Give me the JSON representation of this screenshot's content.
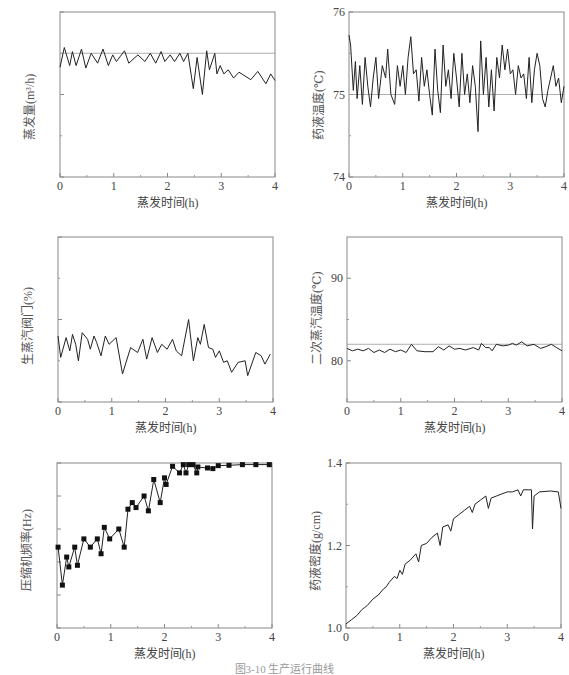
{
  "figure_caption": "图3-10 生产运行曲线",
  "chart_data": [
    {
      "id": "evap_rate",
      "type": "line",
      "title": "",
      "xlabel": "蒸发时间(h)",
      "ylabel": "蒸发量(m³/h)",
      "xlim": [
        0,
        4
      ],
      "ylim": [
        4,
        6
      ],
      "xticks": [
        "0",
        "1",
        "2",
        "3",
        "4"
      ],
      "yticks": [
        "4",
        "5",
        "6"
      ],
      "minor_y": [
        4.5,
        5.5
      ],
      "reference_line": 5.5,
      "series": [
        {
          "name": "蒸发量",
          "x": [
            0,
            0.08,
            0.18,
            0.23,
            0.3,
            0.4,
            0.48,
            0.58,
            0.7,
            0.8,
            0.9,
            0.98,
            1.05,
            1.2,
            1.28,
            1.45,
            1.58,
            1.68,
            1.78,
            1.88,
            1.95,
            2.05,
            2.13,
            2.23,
            2.3,
            2.38,
            2.48,
            2.55,
            2.65,
            2.73,
            2.78,
            2.88,
            2.92,
            2.98,
            3.05,
            3.13,
            3.23,
            3.33,
            3.55,
            3.68,
            3.83,
            3.92,
            4.0
          ],
          "values": [
            5.33,
            5.57,
            5.35,
            5.52,
            5.35,
            5.55,
            5.32,
            5.5,
            5.38,
            5.55,
            5.35,
            5.48,
            5.4,
            5.53,
            5.38,
            5.48,
            5.4,
            5.5,
            5.38,
            5.52,
            5.4,
            5.48,
            5.4,
            5.5,
            5.4,
            5.5,
            5.07,
            5.45,
            5.0,
            5.53,
            5.3,
            5.5,
            5.25,
            5.35,
            5.25,
            5.3,
            5.2,
            5.27,
            5.18,
            5.28,
            5.13,
            5.25,
            5.17
          ]
        }
      ]
    },
    {
      "id": "liquor_temp",
      "type": "line",
      "title": "",
      "xlabel": "蒸发时间(h)",
      "ylabel": "药液温度(℃)",
      "xlim": [
        0,
        4
      ],
      "ylim": [
        74,
        76
      ],
      "xticks": [
        "0",
        "1",
        "2",
        "3",
        "4"
      ],
      "yticks": [
        "74",
        "75",
        "76"
      ],
      "minor_y": [
        74.5,
        75.5
      ],
      "reference_line": 75,
      "series": [
        {
          "name": "药液温度",
          "x": [
            0,
            0.03,
            0.08,
            0.12,
            0.15,
            0.2,
            0.25,
            0.3,
            0.35,
            0.4,
            0.45,
            0.5,
            0.55,
            0.62,
            0.68,
            0.72,
            0.78,
            0.85,
            0.9,
            0.95,
            1.0,
            1.05,
            1.1,
            1.15,
            1.2,
            1.25,
            1.3,
            1.35,
            1.4,
            1.45,
            1.5,
            1.55,
            1.6,
            1.65,
            1.7,
            1.75,
            1.8,
            1.85,
            1.9,
            1.95,
            2.0,
            2.05,
            2.1,
            2.15,
            2.2,
            2.25,
            2.3,
            2.35,
            2.4,
            2.45,
            2.5,
            2.55,
            2.6,
            2.65,
            2.7,
            2.75,
            2.8,
            2.85,
            2.9,
            2.95,
            3.0,
            3.05,
            3.1,
            3.15,
            3.2,
            3.25,
            3.3,
            3.35,
            3.4,
            3.45,
            3.5,
            3.55,
            3.6,
            3.65,
            3.7,
            3.75,
            3.8,
            3.85,
            3.9,
            3.95,
            4.0
          ],
          "values": [
            75.72,
            75.6,
            75.05,
            75.4,
            74.95,
            75.35,
            74.88,
            75.45,
            75.1,
            74.85,
            75.2,
            75.45,
            74.95,
            75.35,
            75.2,
            75.55,
            75.0,
            74.88,
            75.35,
            75.1,
            75.35,
            75.0,
            75.45,
            75.7,
            75.25,
            75.3,
            74.92,
            75.45,
            75.1,
            75.3,
            75.0,
            74.75,
            75.55,
            75.05,
            74.78,
            75.6,
            75.1,
            75.3,
            74.95,
            75.5,
            75.2,
            74.85,
            75.5,
            75.0,
            75.25,
            74.9,
            75.35,
            75.1,
            74.55,
            75.65,
            75.0,
            75.45,
            74.85,
            75.3,
            74.8,
            75.45,
            75.2,
            75.6,
            75.3,
            75.55,
            75.25,
            75.3,
            75.0,
            75.35,
            75.2,
            75.25,
            74.95,
            75.45,
            74.9,
            75.3,
            75.5,
            75.35,
            74.95,
            74.85,
            75.05,
            75.2,
            75.35,
            75.1,
            75.2,
            74.9,
            75.1
          ]
        }
      ]
    },
    {
      "id": "steam_valve",
      "type": "line",
      "title": "",
      "xlabel": "蒸发时间(h)",
      "ylabel": "生蒸汽阀门(%)",
      "xlim": [
        0,
        4
      ],
      "ylim": [
        0,
        100
      ],
      "xticks": [
        "0",
        "1",
        "2",
        "3",
        "4"
      ],
      "yticks": [
        "0",
        "50",
        "100"
      ],
      "minor_y": [
        25,
        75
      ],
      "series": [
        {
          "name": "生蒸汽阀门开度",
          "x": [
            0,
            0.05,
            0.15,
            0.22,
            0.27,
            0.33,
            0.38,
            0.45,
            0.55,
            0.6,
            0.67,
            0.72,
            0.8,
            0.88,
            0.95,
            1.08,
            1.2,
            1.35,
            1.48,
            1.58,
            1.65,
            1.75,
            1.85,
            1.93,
            2.03,
            2.13,
            2.2,
            2.3,
            2.43,
            2.52,
            2.6,
            2.65,
            2.72,
            2.8,
            2.88,
            2.93,
            3.0,
            3.08,
            3.15,
            3.23,
            3.35,
            3.48,
            3.53,
            3.68,
            3.78,
            3.85,
            3.95
          ],
          "values": [
            40,
            27,
            39,
            31,
            41,
            35,
            25,
            42,
            38,
            32,
            40,
            36,
            28,
            40,
            35,
            39,
            17,
            33,
            30,
            38,
            26,
            39,
            30,
            35,
            32,
            38,
            31,
            28,
            50,
            25,
            39,
            35,
            47,
            33,
            32,
            27,
            31,
            24,
            25,
            18,
            24,
            25,
            16,
            30,
            28,
            23,
            29
          ]
        }
      ]
    },
    {
      "id": "secondary_steam_temp",
      "type": "line",
      "title": "",
      "xlabel": "蒸发时间(h)",
      "ylabel": "二次蒸汽温度(℃)",
      "xlim": [
        0,
        4
      ],
      "ylim": [
        75,
        95
      ],
      "xticks": [
        "0",
        "1",
        "2",
        "3",
        "4"
      ],
      "yticks": [
        "80",
        "90"
      ],
      "minor_y": [
        85
      ],
      "reference_line": 82,
      "series": [
        {
          "name": "二次蒸汽温度",
          "x": [
            0,
            0.1,
            0.2,
            0.3,
            0.4,
            0.5,
            0.6,
            0.7,
            0.8,
            0.9,
            1.0,
            1.1,
            1.2,
            1.3,
            1.45,
            1.6,
            1.7,
            1.8,
            1.9,
            2.0,
            2.1,
            2.2,
            2.35,
            2.45,
            2.5,
            2.58,
            2.65,
            2.7,
            2.78,
            2.9,
            3.0,
            3.08,
            3.15,
            3.25,
            3.35,
            3.48,
            3.6,
            3.7,
            3.8,
            3.9,
            4.0
          ],
          "values": [
            81.5,
            81.2,
            81.4,
            81.2,
            81.5,
            81.0,
            81.3,
            81.0,
            81.4,
            81.1,
            81.3,
            81.0,
            82.0,
            81.2,
            81.1,
            81.1,
            81.7,
            81.3,
            81.8,
            81.4,
            81.5,
            81.3,
            81.6,
            81.3,
            82.1,
            81.6,
            81.6,
            81.2,
            82.0,
            81.8,
            81.9,
            82.1,
            81.9,
            82.3,
            81.8,
            82.0,
            81.5,
            81.7,
            82.0,
            81.6,
            81.2
          ]
        }
      ]
    },
    {
      "id": "compressor_freq",
      "type": "line",
      "title": "",
      "xlabel": "蒸发时间(h)",
      "ylabel": "压缩机频率(Hz)",
      "xlim": [
        0,
        4
      ],
      "ylim": [
        500,
        550
      ],
      "xticks": [
        "0",
        "1",
        "2",
        "3",
        "4"
      ],
      "yticks": [
        "500",
        "510",
        "520",
        "530",
        "540",
        "550"
      ],
      "marker": "square",
      "series": [
        {
          "name": "压缩机频率",
          "x": [
            0.02,
            0.1,
            0.18,
            0.22,
            0.33,
            0.38,
            0.5,
            0.62,
            0.75,
            0.82,
            0.88,
            0.98,
            1.15,
            1.25,
            1.32,
            1.4,
            1.47,
            1.62,
            1.7,
            1.8,
            1.92,
            2.0,
            2.03,
            2.15,
            2.28,
            2.35,
            2.4,
            2.45,
            2.53,
            2.6,
            2.62,
            2.8,
            2.9,
            3.0,
            3.2,
            3.45,
            3.7,
            3.95
          ],
          "values": [
            524.5,
            513,
            521.5,
            518.5,
            524.5,
            519,
            527,
            524.5,
            527,
            522.5,
            530.5,
            527,
            530,
            524.5,
            536,
            538,
            536.5,
            540,
            535.5,
            545,
            538,
            545.5,
            543.5,
            549,
            547,
            549.5,
            547,
            549.5,
            549.5,
            547,
            548.8,
            548.5,
            548.3,
            549.2,
            549.3,
            549.5,
            549.5,
            549.5
          ]
        }
      ]
    },
    {
      "id": "liquor_density",
      "type": "line",
      "title": "",
      "xlabel": "蒸发时间(h)",
      "ylabel": "药液密度(g/cm)",
      "xlim": [
        0,
        4
      ],
      "ylim": [
        1.0,
        1.4
      ],
      "xticks": [
        "0",
        "1",
        "2",
        "3",
        "4"
      ],
      "yticks": [
        "1.0",
        "1.2",
        "1.4"
      ],
      "minor_y": [
        1.1,
        1.3
      ],
      "series": [
        {
          "name": "药液密度",
          "x": [
            0,
            0.1,
            0.2,
            0.3,
            0.35,
            0.4,
            0.5,
            0.6,
            0.7,
            0.75,
            0.8,
            0.9,
            0.95,
            1.0,
            1.05,
            1.1,
            1.2,
            1.3,
            1.35,
            1.4,
            1.5,
            1.6,
            1.7,
            1.75,
            1.8,
            1.9,
            1.95,
            2.0,
            2.1,
            2.2,
            2.3,
            2.35,
            2.4,
            2.5,
            2.6,
            2.65,
            2.7,
            2.8,
            2.9,
            3.0,
            3.1,
            3.2,
            3.25,
            3.3,
            3.4,
            3.45,
            3.47,
            3.5,
            3.6,
            3.8,
            3.95,
            4.0
          ],
          "values": [
            1.01,
            1.02,
            1.03,
            1.045,
            1.05,
            1.055,
            1.07,
            1.08,
            1.095,
            1.1,
            1.11,
            1.125,
            1.12,
            1.14,
            1.13,
            1.155,
            1.165,
            1.18,
            1.16,
            1.2,
            1.205,
            1.22,
            1.23,
            1.2,
            1.245,
            1.25,
            1.235,
            1.265,
            1.275,
            1.285,
            1.295,
            1.28,
            1.3,
            1.31,
            1.32,
            1.29,
            1.315,
            1.32,
            1.325,
            1.33,
            1.33,
            1.335,
            1.32,
            1.335,
            1.335,
            1.335,
            1.24,
            1.32,
            1.33,
            1.332,
            1.33,
            1.29
          ]
        }
      ]
    }
  ]
}
